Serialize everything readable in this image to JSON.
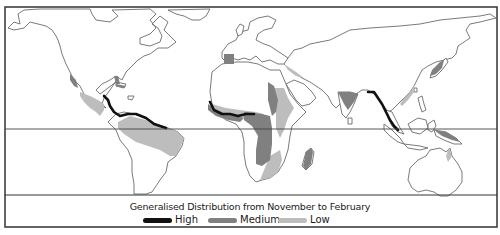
{
  "map": {
    "type": "world distribution map",
    "equator_line": true
  },
  "legend": {
    "title": "Generalised Distribution from November to February",
    "items": [
      {
        "label": "High",
        "color": "#111111"
      },
      {
        "label": "Medium",
        "color": "#808080"
      },
      {
        "label": "Low",
        "color": "#bdbdbd"
      }
    ]
  },
  "colors": {
    "outline": "#6b6b6b",
    "frame": "#333333",
    "high": "#111111",
    "medium": "#808080",
    "low": "#bdbdbd"
  },
  "regions": {
    "high": [
      "Central America Caribbean coast",
      "Northern South America coast",
      "West Africa Gulf of Guinea coast",
      "Southeast Asia / Myanmar-Malaysia coast"
    ],
    "medium": [
      "Iberian Peninsula",
      "Florida",
      "Cuba / Caribbean islands",
      "Central & East Africa",
      "Madagascar",
      "Southern India",
      "Japan (southern)",
      "Pacific Mexico coast"
    ],
    "low": [
      "Mexico / Central America",
      "Northern & Eastern Brazil",
      "East Africa highlands",
      "Southern Africa east",
      "Southern China coast",
      "Northern Australia tip",
      "West African Sahel"
    ]
  }
}
